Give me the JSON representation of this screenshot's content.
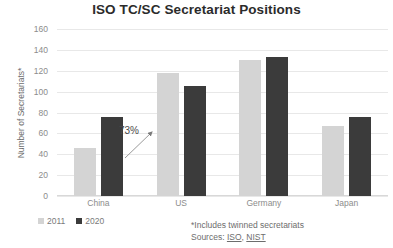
{
  "chart_data": {
    "type": "bar",
    "title": "ISO TC/SC Secretariat Positions",
    "xlabel": "",
    "ylabel": "Number of Secretariats*",
    "categories": [
      "China",
      "US",
      "Germany",
      "Japan"
    ],
    "series": [
      {
        "name": "2011",
        "values": [
          46,
          118,
          130,
          67
        ],
        "color": "#d4d4d4"
      },
      {
        "name": "2020",
        "values": [
          76,
          105,
          133,
          76
        ],
        "color": "#3b3b3b"
      }
    ],
    "ylim": [
      0,
      160
    ],
    "ytick_step": 20,
    "yticks": [
      "160",
      "140",
      "120",
      "100",
      "80",
      "60",
      "40",
      "20",
      "0"
    ],
    "grid": true,
    "legend_position": "bottom-left",
    "annotations": [
      {
        "text": "73%",
        "target": "China 2011 to 2020 growth",
        "arrow": "up-right"
      }
    ],
    "footnotes": [
      "*Includes twinned secretariats"
    ],
    "sources_prefix": "Sources: ",
    "sources": [
      "ISO",
      "NIST"
    ],
    "sources_separator": ", "
  },
  "colors": {
    "series_2011": "#d4d4d4",
    "series_2020": "#3b3b3b",
    "gridline": "#e8e8e8",
    "title_text": "#2b2b2b",
    "axis_text": "#8c8c8c",
    "background": "#ffffff"
  }
}
